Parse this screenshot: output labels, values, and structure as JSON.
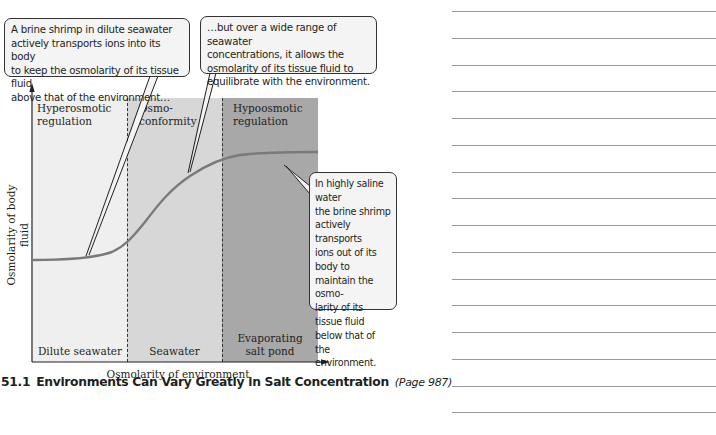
{
  "figure": {
    "regions": [
      {
        "title": "Hyperosmotic\nregulation",
        "environment": "Dilute seawater",
        "color": "#efefef"
      },
      {
        "title": "Osmo-\nconformity",
        "environment": "Seawater",
        "color": "#d7d7d7"
      },
      {
        "title": "Hypoosmotic\nregulation",
        "environment": "Evaporating\nsalt pond",
        "color": "#a8a8a8"
      }
    ],
    "y_axis_label": "Osmolarity of body fluid",
    "x_axis_label": "Osmolarity of environment",
    "curve_color": "#7a7a7a",
    "callouts": [
      {
        "id": "hyperosmotic",
        "text": "A brine shrimp in dilute seawater\nactively transports ions into its body\nto keep the osmolarity of its tissue fluid\nabove that of the environment…"
      },
      {
        "id": "conformity",
        "text": "…but over a wide range of seawater\nconcentrations, it allows the\nosmolarity of its tissue fluid to\nequilibrate with the environment."
      },
      {
        "id": "hypoosmotic",
        "text": "In highly saline water\nthe brine shrimp\nactively transports\nions out of its body to\nmaintain the osmo-\nlarity of its tissue fluid\nbelow that of the\nenvironment."
      }
    ]
  },
  "caption": {
    "number": "51.1",
    "title": "Environments Can Vary Greatly in Salt Concentration",
    "page_ref": "(Page 987)"
  },
  "notes": {
    "line_count": 16
  }
}
